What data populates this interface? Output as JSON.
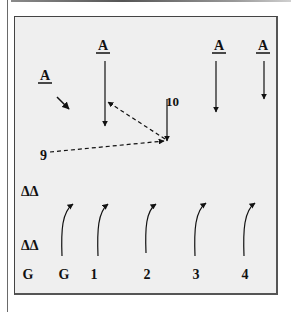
{
  "diagram": {
    "attackers": [
      {
        "label": "A",
        "x": 45,
        "y": 80
      },
      {
        "label": "A",
        "x": 103,
        "y": 50
      },
      {
        "label": "A",
        "x": 219,
        "y": 50
      },
      {
        "label": "A",
        "x": 263,
        "y": 50
      }
    ],
    "player_numbers": {
      "ten": "10",
      "nine": "9"
    },
    "deltas": [
      {
        "label": "ΔΔ",
        "x": 35,
        "y": 196
      },
      {
        "label": "ΔΔ",
        "x": 35,
        "y": 250
      }
    ],
    "bottom_labels": [
      {
        "label": "G",
        "x": 28
      },
      {
        "label": "G",
        "x": 64
      },
      {
        "label": "1",
        "x": 94
      },
      {
        "label": "2",
        "x": 147
      },
      {
        "label": "3",
        "x": 196
      },
      {
        "label": "4",
        "x": 245
      }
    ],
    "colors": {
      "panel_bg": "#efefef",
      "ink": "#111111",
      "border": "#444444"
    }
  }
}
